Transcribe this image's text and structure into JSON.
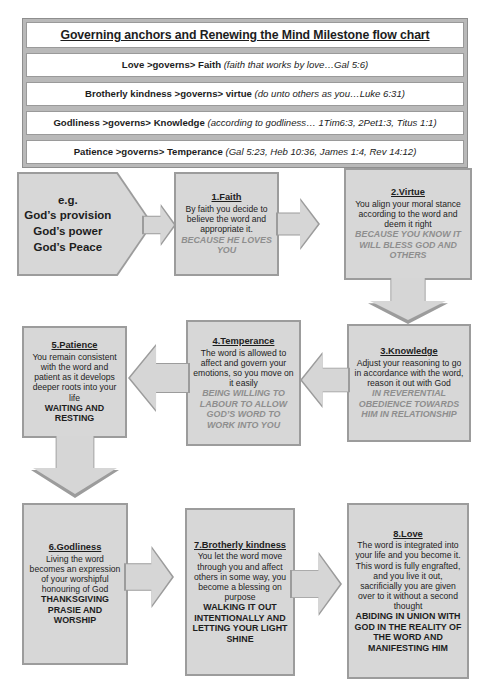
{
  "header": {
    "title": "Governing anchors and Renewing the Mind Milestone flow chart",
    "rows": [
      {
        "bold": "Love >governs> Faith ",
        "italic": "(faith that works by love…Gal 5:6)"
      },
      {
        "bold": "Brotherly kindness >governs> virtue ",
        "italic": "(do unto others as you…Luke 6:31)"
      },
      {
        "bold": "Godliness >governs> Knowledge ",
        "italic": "(according to godliness… 1Tim6:3, 2Pet1:3, Titus 1:1)"
      },
      {
        "bold": "Patience >governs> Temperance ",
        "italic": "(Gal 5:23, Heb 10:36, James 1:4, Rev 14:12)"
      }
    ]
  },
  "start": {
    "lines": [
      "e.g.",
      "God’s provision",
      "God’s power",
      "God’s Peace"
    ]
  },
  "nodes": {
    "faith": {
      "title": "1.Faith",
      "body": "By faith you decide to believe the word and appropriate it.",
      "emphasis": "BECAUSE HE LOVES YOU",
      "emphasis_style": "italic-grey"
    },
    "virtue": {
      "title": "2.Virtue",
      "body": "You align your moral stance according to the word and deem it right",
      "emphasis": "BECAUSE YOU KNOW IT WILL BLESS GOD AND OTHERS",
      "emphasis_style": "italic-grey"
    },
    "knowledge": {
      "title": "3.Knowledge",
      "body": "Adjust your reasoning to go in accordance with the word, reason it out with God",
      "emphasis": "IN REVERENTIAL OBEDIENCE TOWARDS HIM IN RELATIONSHIP",
      "emphasis_style": "italic-grey"
    },
    "temperance": {
      "title": "4.Temperance",
      "body": "The word is allowed to affect and govern your emotions, so you move on it easily",
      "emphasis": "BEING WILLING TO LABOUR TO ALLOW GOD’S WORD TO WORK INTO YOU",
      "emphasis_style": "italic-grey"
    },
    "patience": {
      "title": "5.Patience",
      "body": "You remain consistent with the word and patient as it develops deeper roots into your life",
      "emphasis": "WAITING AND RESTING",
      "emphasis_style": "bold-dark"
    },
    "godliness": {
      "title": "6.Godliness",
      "body": "Living the word becomes an expression of your worshipful honouring of God",
      "emphasis": "THANKSGIVING PRASIE AND WORSHIP",
      "emphasis_style": "bold-dark"
    },
    "brotherly": {
      "title": "7.Brotherly kindness",
      "body": "You let the word move through you and affect others in some way, you become a blessing on purpose",
      "emphasis": "WALKING IT OUT INTENTIONALLY AND LETTING YOUR LIGHT SHINE",
      "emphasis_style": "bold-dark"
    },
    "love": {
      "title": "8.Love",
      "body": "The word is integrated into your life and you become it. This word is fully engrafted, and you live it out, sacrificially you are given over to it without a second thought",
      "emphasis": "ABIDING IN UNION WITH GOD IN THE REALITY OF THE WORD AND MANIFESTING HIM",
      "emphasis_style": "bold-dark"
    }
  },
  "connectors": {
    "start_to_faith": "arrow-right",
    "faith_to_virtue": "arrow-right",
    "virtue_to_knowledge": "arrow-down",
    "knowledge_to_temperance": "arrow-left",
    "temperance_to_patience": "arrow-left",
    "patience_to_godliness": "arrow-down",
    "godliness_to_brotherly": "arrow-right",
    "brotherly_to_love": "arrow-right"
  },
  "colors": {
    "shape_fill": "#d7d7d7",
    "shape_border": "#9c9c9c",
    "header_frame": "#b9b9b9",
    "emphasis_grey": "#8e8e8e"
  },
  "footer": {
    "page": ""
  }
}
